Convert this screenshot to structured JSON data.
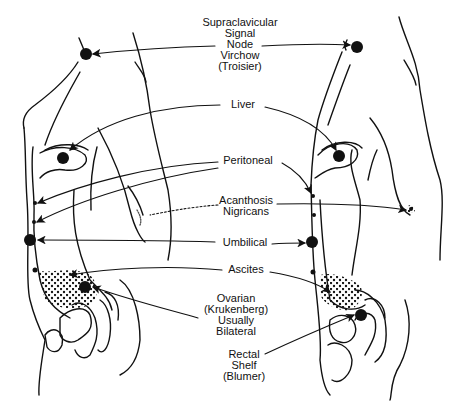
{
  "diagram": {
    "colors": {
      "ink": "#111111",
      "background": "#ffffff",
      "stipple": "#555555"
    },
    "labels": [
      {
        "id": "supraclavicular",
        "lines": [
          "Supraclavicular",
          "Signal",
          "Node",
          "Virchow",
          "(Troisier)"
        ]
      },
      {
        "id": "liver",
        "lines": [
          "Liver"
        ]
      },
      {
        "id": "peritoneal",
        "lines": [
          "Peritoneal"
        ]
      },
      {
        "id": "acanthosis",
        "lines": [
          "Acanthosis",
          "Nigricans"
        ]
      },
      {
        "id": "umbilical",
        "lines": [
          "Umbilical"
        ]
      },
      {
        "id": "ascites",
        "lines": [
          "Ascites"
        ]
      },
      {
        "id": "ovarian",
        "lines": [
          "Ovarian",
          "(Krukenberg)",
          "Usually",
          "Bilateral"
        ]
      },
      {
        "id": "rectal",
        "lines": [
          "Rectal",
          "Shelf",
          "(Blumer)"
        ]
      }
    ],
    "figures": [
      {
        "id": "left-figure",
        "description": "female torso, lateral view"
      },
      {
        "id": "right-figure",
        "description": "male torso, lateral view"
      }
    ]
  }
}
